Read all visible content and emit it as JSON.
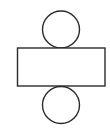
{
  "diagram": {
    "canvas": {
      "width": 110,
      "height": 131,
      "background_color": "#ffffff"
    },
    "style": {
      "stroke_color": "#2b2b2b",
      "fill_color": "#ffffff",
      "stroke_width": 1.4
    },
    "shapes": [
      {
        "name": "top-circle",
        "type": "circle",
        "cx": 61,
        "cy": 29.5,
        "r": 18.5,
        "label": ""
      },
      {
        "name": "center-rectangle",
        "type": "rect",
        "x": 17.5,
        "y": 48,
        "width": 87.5,
        "height": 38,
        "label": ""
      },
      {
        "name": "bottom-circle",
        "type": "circle",
        "cx": 61,
        "cy": 105,
        "r": 18.5,
        "label": ""
      }
    ]
  }
}
